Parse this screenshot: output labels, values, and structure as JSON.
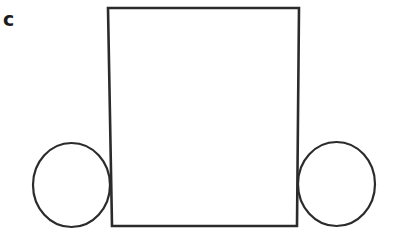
{
  "figure": {
    "panel_label": "c",
    "background_color": "#ffffff",
    "stroke_color": "#2b2b2b",
    "label_color": "#1a1a1a",
    "shapes": {
      "body_rectangle": {
        "name": "rectangle",
        "stroke_width": 2.6,
        "points": [
          {
            "x": 108,
            "y": 8
          },
          {
            "x": 299,
            "y": 8
          },
          {
            "x": 297,
            "y": 226
          },
          {
            "x": 112,
            "y": 226
          }
        ]
      },
      "left_wheel": {
        "name": "circle",
        "stroke_width": 2.2,
        "cx": 71.5,
        "cy": 185,
        "rx": 38.5,
        "ry": 42
      },
      "right_wheel": {
        "name": "circle",
        "stroke_width": 2.2,
        "cx": 336.5,
        "cy": 184,
        "rx": 38.5,
        "ry": 42
      }
    }
  }
}
